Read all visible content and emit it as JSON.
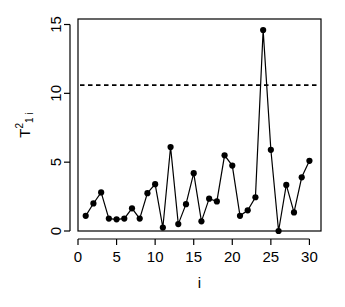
{
  "chart_data": {
    "type": "line",
    "title": "",
    "subtitle": "",
    "xlabel": "i",
    "ylabel": "T1i^2",
    "ylabel_base": "T",
    "ylabel_superscript": "2",
    "ylabel_subscript": "1 i",
    "x": [
      1,
      2,
      3,
      4,
      5,
      6,
      7,
      8,
      9,
      10,
      11,
      12,
      13,
      14,
      15,
      16,
      17,
      18,
      19,
      20,
      21,
      22,
      23,
      24,
      25,
      26,
      27,
      28,
      29,
      30
    ],
    "values": [
      1.1,
      2.0,
      2.8,
      0.9,
      0.85,
      0.9,
      1.65,
      0.9,
      2.75,
      3.4,
      0.25,
      6.1,
      0.5,
      1.95,
      4.2,
      0.7,
      2.35,
      2.15,
      5.5,
      4.75,
      1.1,
      1.5,
      2.45,
      14.6,
      5.9,
      0.0,
      3.35,
      1.35,
      3.9,
      5.1
    ],
    "series": [
      {
        "name": "T1i^2",
        "values": [
          1.1,
          2.0,
          2.8,
          0.9,
          0.85,
          0.9,
          1.65,
          0.9,
          2.75,
          3.4,
          0.25,
          6.1,
          0.5,
          1.95,
          4.2,
          0.7,
          2.35,
          2.15,
          5.5,
          4.75,
          1.1,
          1.5,
          2.45,
          14.6,
          5.9,
          0.0,
          3.35,
          1.35,
          3.9,
          5.1
        ],
        "marker": "filled-circle",
        "line_style": "solid",
        "color": "#000000"
      }
    ],
    "xlim": [
      0,
      31.5
    ],
    "ylim": [
      0,
      15.4
    ],
    "xticks": [
      0,
      5,
      10,
      15,
      20,
      25,
      30
    ],
    "xtick_labels": [
      "0",
      "5",
      "10",
      "15",
      "20",
      "25",
      "30"
    ],
    "yticks": [
      0,
      5,
      10,
      15
    ],
    "ytick_labels": [
      "0",
      "5",
      "10",
      "15"
    ],
    "grid": false,
    "legend": null,
    "legend_position": "none",
    "annotations": [
      {
        "type": "hline",
        "name": "control-limit",
        "value": 10.6,
        "line_style": "dashed",
        "color": "#000000",
        "label": ""
      }
    ],
    "colors": {
      "line": "#000000",
      "marker": "#000000",
      "threshold": "#000000",
      "axis": "#000000",
      "background": "#ffffff"
    }
  }
}
